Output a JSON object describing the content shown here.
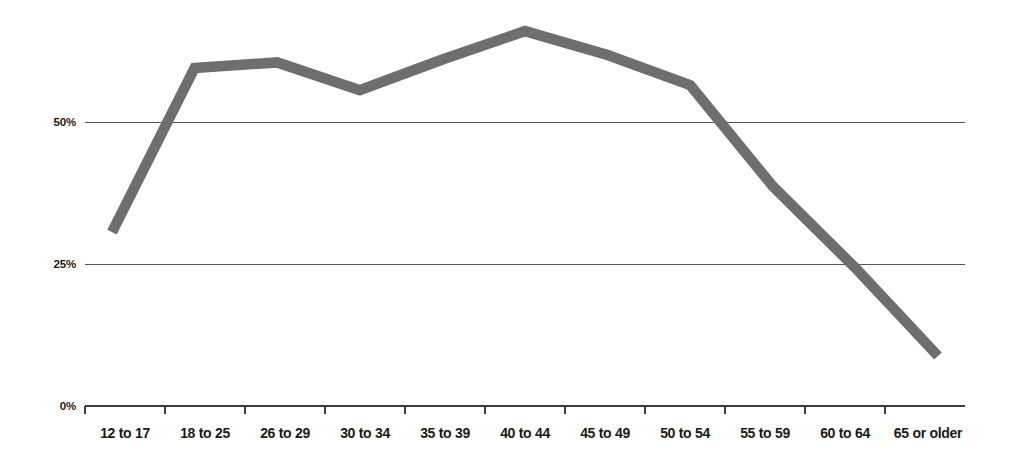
{
  "chart_data": {
    "type": "line",
    "title": "",
    "subtitle": "",
    "xlabel": "",
    "ylabel": "",
    "categories": [
      "12 to 17",
      "18 to 25",
      "26 to 29",
      "30 to 34",
      "35 to 39",
      "40 to 44",
      "45 to 49",
      "50 to 54",
      "55 to 59",
      "60 to 64",
      "65 or older"
    ],
    "values": [
      30.6,
      59.5,
      60.5,
      55.6,
      61.0,
      66.0,
      61.8,
      56.5,
      38.7,
      24.3,
      8.8
    ],
    "series": [
      {
        "name": "",
        "values": [
          30.6,
          59.5,
          60.5,
          55.6,
          61.0,
          66.0,
          61.8,
          56.5,
          38.7,
          24.3,
          8.8
        ]
      }
    ],
    "ylim": [
      0,
      75
    ],
    "y_ticks": [
      0,
      25,
      50
    ],
    "y_tick_labels": [
      "0%",
      "25%",
      "50%"
    ],
    "gridlines": "horizontal",
    "legend": "none",
    "line_color": "#6e6e6e",
    "axis_color": "#3d3d3d",
    "grid_color": "#555555",
    "text_color": "#1a1a1a",
    "background_color": "#ffffff"
  }
}
